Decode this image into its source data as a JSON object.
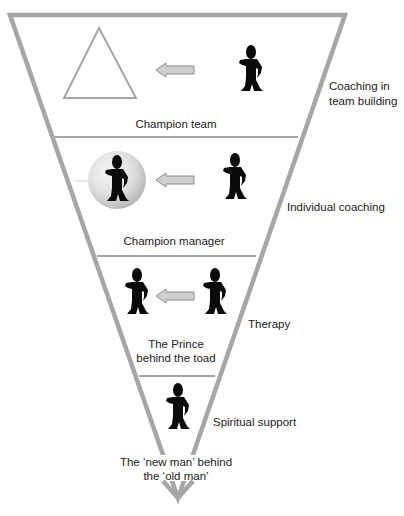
{
  "diagram": {
    "type": "inverted-triangle-levels",
    "colors": {
      "outline": "#a6a6a6",
      "figure": "#0a0a0a",
      "arrow_fill": "#cfcfcf",
      "arrow_stroke": "#8c8c8c",
      "sphere_light": "#f2f2f2",
      "sphere_dark": "#b9b9b9",
      "text": "#222222"
    },
    "levels": [
      {
        "caption": "Champion team",
        "side_label_line1": "Coaching in",
        "side_label_line2": "team building",
        "left_icon": "triangle-icon",
        "right_icon": "person-icon"
      },
      {
        "caption": "Champion manager",
        "side_label": "Individual coaching",
        "left_icon": "person-in-sphere-icon",
        "right_icon": "person-icon"
      },
      {
        "caption_line1": "The Prince",
        "caption_line2": "behind the toad",
        "side_label": "Therapy",
        "left_icon": "person-icon",
        "right_icon": "person-icon"
      },
      {
        "caption_line1": "The ‘new man’ behind",
        "caption_line2": "the ‘old man’",
        "side_label": "Spiritual support",
        "icon": "person-icon"
      }
    ]
  }
}
